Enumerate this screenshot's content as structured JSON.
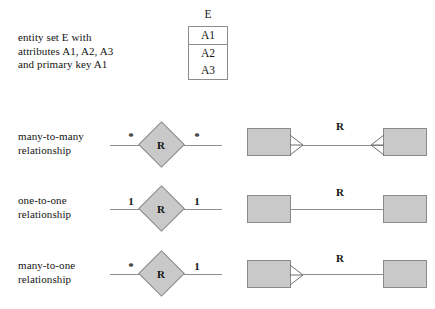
{
  "diagram": {
    "title_hidden": "",
    "entity_legend": {
      "description": "entity set E with\nattributes A1, A2, A3\nand primary key A1",
      "entity_name": "E",
      "primary_key": "A1",
      "attributes": [
        "A2",
        "A3"
      ]
    },
    "relationship_label": "R",
    "rows": [
      {
        "caption": "many-to-many\nrelationship",
        "left_cardinality": "*",
        "right_cardinality": "*",
        "relationship_label": "R",
        "uml_left_crowsfoot": true,
        "uml_right_crowsfoot": true
      },
      {
        "caption": "one-to-one\nrelationship",
        "left_cardinality": "1",
        "right_cardinality": "1",
        "relationship_label": "R",
        "uml_left_crowsfoot": false,
        "uml_right_crowsfoot": false
      },
      {
        "caption": "many-to-one\nrelationship",
        "left_cardinality": "*",
        "right_cardinality": "1",
        "relationship_label": "R",
        "uml_left_crowsfoot": true,
        "uml_right_crowsfoot": false
      }
    ],
    "colors": {
      "shape_fill": "#c9c9c9",
      "shape_stroke": "#8a8a8a",
      "line": "#8f8f8f",
      "text": "#141414",
      "background": "#ffffff"
    }
  }
}
